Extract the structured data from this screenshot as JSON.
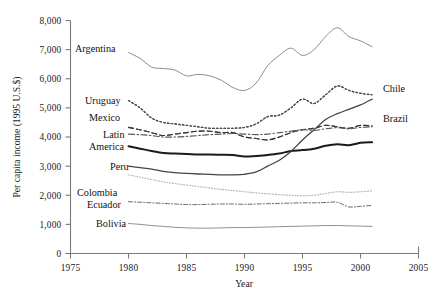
{
  "chart_data": {
    "type": "line",
    "title": "",
    "xlabel": "Year",
    "ylabel": "Per capita income (1995 U.S.$)",
    "xlim": [
      1975,
      2005
    ],
    "ylim": [
      0,
      8000
    ],
    "xticks": [
      "1975",
      "1980",
      "1985",
      "1990",
      "1995",
      "2000",
      "2005"
    ],
    "yticks": [
      "0",
      "1,000",
      "2,000",
      "3,000",
      "4,000",
      "5,000",
      "6,000",
      "7,000",
      "8,000"
    ],
    "grid": false,
    "legend_position": "inline-labels",
    "x": [
      1980,
      1981,
      1982,
      1983,
      1984,
      1985,
      1986,
      1987,
      1988,
      1989,
      1990,
      1991,
      1992,
      1993,
      1994,
      1995,
      1996,
      1997,
      1998,
      1999,
      2000,
      2001
    ],
    "series": [
      {
        "name": "Argentina",
        "label": "Argentina",
        "label_side": "left",
        "style": "solid",
        "color": "#8c8c8c",
        "width": 1.0,
        "values": [
          6900,
          6700,
          6400,
          6350,
          6300,
          6100,
          6150,
          6100,
          5950,
          5700,
          5600,
          5850,
          6450,
          6800,
          7050,
          6800,
          7000,
          7450,
          7750,
          7450,
          7300,
          7100
        ]
      },
      {
        "name": "Chile",
        "label": "Chile",
        "label_side": "right",
        "style": "dotted",
        "color": "#4d4d4d",
        "width": 1.2,
        "values": [
          5250,
          5000,
          4650,
          4500,
          4450,
          4400,
          4350,
          4300,
          4300,
          4300,
          4330,
          4450,
          4700,
          4750,
          5000,
          5300,
          5150,
          5450,
          5750,
          5600,
          5500,
          5450
        ]
      },
      {
        "name": "Uruguay",
        "label": "Uruguay",
        "label_side": "left",
        "style": "dotted",
        "color": "#4d4d4d",
        "width": 1.2,
        "values": [
          5250,
          5000,
          4650,
          4500,
          4450,
          4400,
          4350,
          4300,
          4300,
          4300,
          4330,
          4450,
          4700,
          4750,
          5000,
          5300,
          5150,
          5450,
          5750,
          5600,
          5500,
          5450
        ]
      },
      {
        "name": "Brazil",
        "label": "Brazil",
        "label_side": "right",
        "style": "dashed",
        "color": "#3a3a3a",
        "width": 1.1,
        "values": [
          4330,
          4250,
          4150,
          4050,
          4100,
          4150,
          4200,
          4200,
          4150,
          4150,
          4000,
          3950,
          3900,
          4000,
          4150,
          4250,
          4300,
          4400,
          4350,
          4300,
          4400,
          4380
        ]
      },
      {
        "name": "Mexico",
        "label": "Mexico",
        "label_side": "left",
        "style": "dashed",
        "color": "#3a3a3a",
        "width": 1.1,
        "values": [
          4330,
          4250,
          4150,
          4050,
          4100,
          4150,
          4200,
          4200,
          4150,
          4150,
          4000,
          3950,
          3900,
          4000,
          4150,
          4250,
          4300,
          4400,
          4350,
          4300,
          4400,
          4380
        ]
      },
      {
        "name": "Colombia",
        "label": "Colombia",
        "label_side": "left",
        "style": "dashdot",
        "color": "#555555",
        "width": 1.1,
        "values": [
          4100,
          4080,
          4050,
          4000,
          4000,
          4020,
          4050,
          4080,
          4100,
          4120,
          4100,
          4080,
          4100,
          4150,
          4200,
          4250,
          4230,
          4280,
          4320,
          4280,
          4330,
          4350
        ]
      },
      {
        "name": "Latin America",
        "label": "Latin\nAmerica",
        "label_side": "left",
        "style": "solid",
        "color": "#1a1a1a",
        "width": 2.0,
        "values": [
          3680,
          3600,
          3520,
          3450,
          3430,
          3420,
          3400,
          3400,
          3390,
          3380,
          3330,
          3350,
          3380,
          3430,
          3520,
          3550,
          3600,
          3700,
          3750,
          3720,
          3800,
          3820
        ]
      },
      {
        "name": "Peru",
        "label": "Peru",
        "label_side": "left",
        "style": "solid",
        "color": "#444444",
        "width": 1.3,
        "values": [
          3000,
          2950,
          2900,
          2820,
          2780,
          2750,
          2730,
          2720,
          2700,
          2700,
          2720,
          2800,
          3000,
          3200,
          3500,
          3900,
          4250,
          4600,
          4800,
          4950,
          5100,
          5300
        ]
      },
      {
        "name": "Ecuador",
        "label": "Ecuador",
        "label_side": "left",
        "style": "dashdot-fine",
        "color": "#555555",
        "width": 0.9,
        "values": [
          1780,
          1760,
          1740,
          1720,
          1700,
          1680,
          1680,
          1690,
          1700,
          1700,
          1690,
          1700,
          1710,
          1720,
          1730,
          1740,
          1740,
          1750,
          1760,
          1600,
          1620,
          1650
        ]
      },
      {
        "name": "Bolivia",
        "label": "Bolivia",
        "label_side": "left",
        "style": "solid",
        "color": "#909090",
        "width": 1.0,
        "values": [
          1030,
          1000,
          960,
          930,
          900,
          880,
          870,
          870,
          880,
          890,
          890,
          900,
          910,
          920,
          930,
          940,
          950,
          960,
          960,
          950,
          940,
          930
        ]
      },
      {
        "name": "Venezuela-dotted",
        "label": "",
        "label_side": "none",
        "style": "fine-dotted",
        "color": "#a0a0a0",
        "width": 1.0,
        "values": [
          2700,
          2620,
          2540,
          2460,
          2400,
          2350,
          2300,
          2250,
          2200,
          2160,
          2120,
          2080,
          2050,
          2020,
          2000,
          1980,
          2000,
          2060,
          2120,
          2100,
          2120,
          2150
        ]
      }
    ],
    "annotations": [
      {
        "text": "Argentina",
        "x": 75,
        "y": 52
      },
      {
        "text": "Uruguay",
        "x": 85,
        "y": 104
      },
      {
        "text": "Mexico",
        "x": 89,
        "y": 121
      },
      {
        "text": "Latin",
        "x": 103,
        "y": 138
      },
      {
        "text": "America",
        "x": 89,
        "y": 150
      },
      {
        "text": "Peru",
        "x": 110,
        "y": 170
      },
      {
        "text": "Colombia",
        "x": 77,
        "y": 196
      },
      {
        "text": "Ecuador",
        "x": 87,
        "y": 208
      },
      {
        "text": "Bolivia",
        "x": 96,
        "y": 227
      },
      {
        "text": "Chile",
        "x": 383,
        "y": 92
      },
      {
        "text": "Brazil",
        "x": 383,
        "y": 122
      }
    ]
  },
  "axes": {
    "x_axis_title": "Year",
    "y_axis_title": "Per capita income (1995 U.S.$)"
  }
}
